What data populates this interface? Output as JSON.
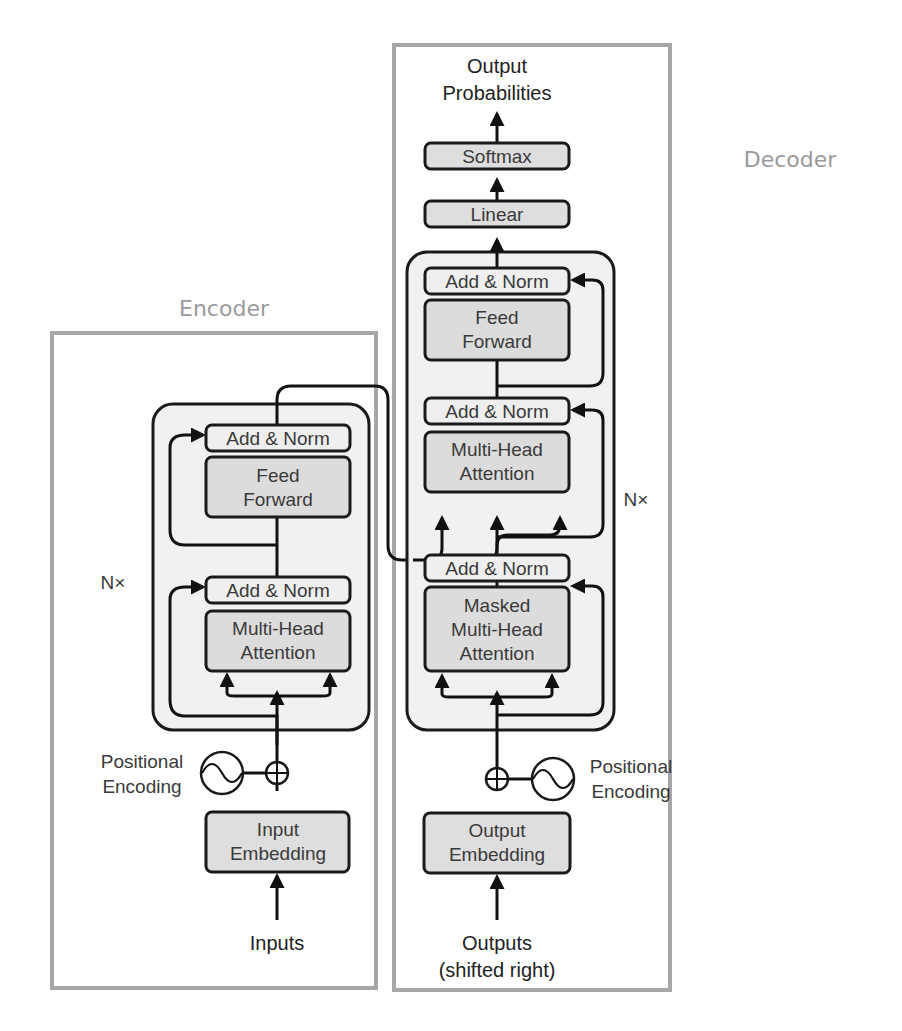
{
  "titles": {
    "encoder": "Encoder",
    "decoder": "Decoder"
  },
  "encoder": {
    "inputs_label": "Inputs",
    "embedding": [
      "Input",
      "Embedding"
    ],
    "positional_encoding": [
      "Positional",
      "Encoding"
    ],
    "repeat_label": "N×",
    "blocks": {
      "attention": [
        "Multi-Head",
        "Attention"
      ],
      "add_norm_1": "Add & Norm",
      "feed_forward": [
        "Feed",
        "Forward"
      ],
      "add_norm_2": "Add & Norm"
    }
  },
  "decoder": {
    "outputs_label": [
      "Outputs",
      "(shifted right)"
    ],
    "embedding": [
      "Output",
      "Embedding"
    ],
    "positional_encoding": [
      "Positional",
      "Encoding"
    ],
    "repeat_label": "N×",
    "blocks": {
      "masked_attention": [
        "Masked",
        "Multi-Head",
        "Attention"
      ],
      "add_norm_1": "Add & Norm",
      "cross_attention": [
        "Multi-Head",
        "Attention"
      ],
      "add_norm_2": "Add & Norm",
      "feed_forward": [
        "Feed",
        "Forward"
      ],
      "add_norm_3": "Add & Norm"
    },
    "linear": "Linear",
    "softmax": "Softmax",
    "output_label": [
      "Output",
      "Probabilities"
    ]
  },
  "colors": {
    "frame": "#a7a7a7",
    "stack_fill": "#f1f1f1",
    "main_block_fill": "#dcdcdc",
    "norm_block_fill": "#efefef",
    "title_text": "#9a9a9a",
    "line": "#111111"
  }
}
